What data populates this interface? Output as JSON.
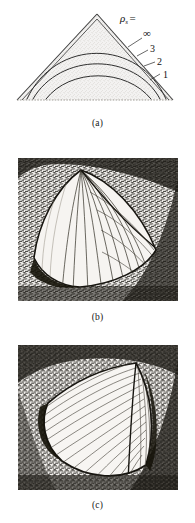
{
  "figure": {
    "panels": [
      {
        "id": "a",
        "caption": "(a)",
        "type": "line-diagram",
        "description": "Stippled triangular wedge cross-section with nested curved contour lines rising to a common apex",
        "parameter_symbol": "ρ",
        "parameter_subscript": "s",
        "parameter_equals": "=",
        "parameter_label": "ρs =",
        "contour_labels": [
          "∞",
          "3",
          "2",
          "1"
        ]
      },
      {
        "id": "b",
        "caption": "(b)",
        "type": "photograph",
        "description": "Halftone photograph of a curved sail-like wedge surface with straight generator striations on a dark mottled background"
      },
      {
        "id": "c",
        "caption": "(c)",
        "type": "photograph",
        "description": "Halftone photograph of a curved wedge surface with dense fine curved striations on a dark mottled background"
      }
    ]
  },
  "colors": {
    "ink": "#161616",
    "paper": "#ffffff",
    "stipple": "#cfcbc6",
    "photo_light": "#f3f1ee",
    "photo_dark": "#17150f"
  }
}
